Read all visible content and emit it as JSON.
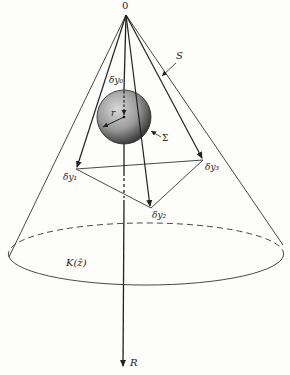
{
  "diagram": {
    "type": "geometric cone diagram",
    "colors": {
      "ink": "#222222",
      "sphere_light": "#c9c9c9",
      "sphere_dark": "#3a3a3a",
      "background": "#fdfdfc"
    },
    "labels": {
      "apex": "0",
      "cone_surface": "S",
      "sphere": "Σ",
      "radius": "r",
      "delta_y0": "δy₀",
      "delta_y1": "δy₁",
      "delta_y2": "δy₂",
      "delta_y3": "δy₃",
      "base": "K(ẑ)",
      "axis": "R"
    },
    "points": {
      "apex": [
        126,
        15
      ],
      "sphere_center": [
        124,
        117
      ],
      "sphere_radius": 27,
      "delta_y1": [
        76,
        169
      ],
      "delta_y2": [
        151,
        208
      ],
      "delta_y3": [
        203,
        160
      ],
      "cone_left_base": [
        9,
        257
      ],
      "cone_right_base": [
        283,
        240
      ],
      "axis_end": [
        123,
        370
      ]
    }
  }
}
